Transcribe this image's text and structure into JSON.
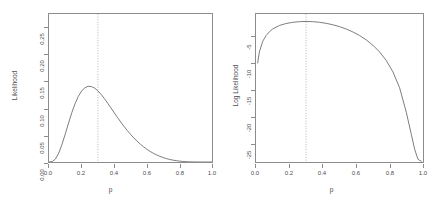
{
  "chart_data": [
    {
      "type": "line",
      "panel": "left",
      "title": "",
      "xlabel": "p",
      "ylabel": "Likelihood",
      "xlim": [
        0.0,
        1.0
      ],
      "ylim": [
        0.0,
        0.2755
      ],
      "xticks": [
        "0.0",
        "0.2",
        "0.4",
        "0.6",
        "0.8",
        "1.0"
      ],
      "xtick_values": [
        0.0,
        0.2,
        0.4,
        0.6,
        0.8,
        1.0
      ],
      "yticks": [
        "0.00",
        "0.05",
        "0.10",
        "0.15",
        "0.20",
        "0.25"
      ],
      "ytick_values": [
        0.0,
        0.05,
        0.1,
        0.15,
        0.2,
        0.25
      ],
      "grid": false,
      "legend": "none",
      "annotations": [
        {
          "kind": "vertical-dotted-line",
          "name": "mle-line",
          "x": 0.3,
          "label": ""
        }
      ],
      "x": [
        0.0,
        0.02,
        0.04,
        0.06,
        0.08,
        0.1,
        0.12,
        0.14,
        0.16,
        0.18,
        0.2,
        0.22,
        0.24,
        0.26,
        0.28,
        0.3,
        0.32,
        0.34,
        0.36,
        0.38,
        0.4,
        0.42,
        0.44,
        0.46,
        0.48,
        0.5,
        0.52,
        0.54,
        0.56,
        0.58,
        0.6,
        0.62,
        0.64,
        0.66,
        0.68,
        0.7,
        0.72,
        0.74,
        0.76,
        0.78,
        0.8,
        0.82,
        0.84,
        0.86,
        0.88,
        0.9,
        0.92,
        0.94,
        0.96,
        0.98,
        1.0
      ],
      "values": [
        0.0,
        0.0008,
        0.0057,
        0.0168,
        0.0331,
        0.0523,
        0.0725,
        0.0918,
        0.1086,
        0.1222,
        0.1321,
        0.1382,
        0.1409,
        0.1405,
        0.1375,
        0.1324,
        0.1258,
        0.118,
        0.1095,
        0.1007,
        0.0918,
        0.083,
        0.0745,
        0.0664,
        0.0587,
        0.0516,
        0.045,
        0.0389,
        0.0333,
        0.0283,
        0.0238,
        0.0198,
        0.0163,
        0.0132,
        0.0106,
        0.0083,
        0.0064,
        0.0048,
        0.0035,
        0.0025,
        0.0017,
        0.0011,
        0.0006,
        0.0003,
        0.0002,
        0.0001,
        0.0,
        0.0,
        0.0,
        0.0,
        0.0
      ]
    },
    {
      "type": "line",
      "panel": "right",
      "title": "",
      "xlabel": "p",
      "ylabel": "Log Likelihood",
      "xlim": [
        0.0,
        1.0
      ],
      "ylim": [
        -28.5,
        -0.7
      ],
      "xticks": [
        "0.0",
        "0.2",
        "0.4",
        "0.6",
        "0.8",
        "1.0"
      ],
      "xtick_values": [
        0.0,
        0.2,
        0.4,
        0.6,
        0.8,
        1.0
      ],
      "yticks": [
        "-5",
        "-10",
        "-15",
        "-20",
        "-25"
      ],
      "ytick_values": [
        -5,
        -10,
        -15,
        -20,
        -25
      ],
      "grid": false,
      "legend": "none",
      "annotations": [
        {
          "kind": "vertical-dotted-line",
          "name": "mle-line",
          "x": 0.3,
          "label": ""
        }
      ],
      "x": [
        0.01,
        0.02,
        0.04,
        0.06,
        0.08,
        0.1,
        0.14,
        0.18,
        0.22,
        0.26,
        0.3,
        0.34,
        0.38,
        0.42,
        0.46,
        0.5,
        0.54,
        0.58,
        0.62,
        0.66,
        0.7,
        0.74,
        0.78,
        0.82,
        0.86,
        0.9,
        0.93,
        0.95,
        0.97,
        0.98,
        0.99
      ],
      "values": [
        -9.9,
        -7.85,
        -5.86,
        -4.76,
        -4.03,
        -3.51,
        -2.86,
        -2.49,
        -2.26,
        -2.14,
        -2.1,
        -2.14,
        -2.26,
        -2.45,
        -2.72,
        -3.07,
        -3.52,
        -4.07,
        -4.74,
        -5.56,
        -6.57,
        -7.83,
        -9.44,
        -11.57,
        -14.57,
        -19.16,
        -23.3,
        -26.1,
        -28.0,
        -28.2,
        -28.35
      ]
    }
  ],
  "panels": {
    "left": {
      "name": "likelihood-panel",
      "ylabel": "Likelihood",
      "xlabel": "p",
      "yticks": [
        "0.00",
        "0.05",
        "0.10",
        "0.15",
        "0.20",
        "0.25"
      ],
      "xticks": [
        "0.0",
        "0.2",
        "0.4",
        "0.6",
        "0.8",
        "1.0"
      ]
    },
    "right": {
      "name": "log-likelihood-panel",
      "ylabel": "Log Likelihood",
      "xlabel": "p",
      "yticks": [
        "-5",
        "-10",
        "-15",
        "-20",
        "-25"
      ],
      "xticks": [
        "0.0",
        "0.2",
        "0.4",
        "0.6",
        "0.8",
        "1.0"
      ]
    }
  },
  "style": {
    "axis_color": "#8c8c8c",
    "curve_color": "#6e6e6e",
    "dotted_color": "#a8a8a8",
    "text_color": "#4d4d4d",
    "background": "#ffffff"
  }
}
